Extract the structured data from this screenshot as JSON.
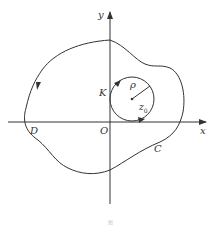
{
  "diagram": {
    "axes": {
      "x_label": "x",
      "y_label": "y",
      "origin_label": "O"
    },
    "curve": {
      "label": "C",
      "point_label": "D",
      "orientation": "counterclockwise"
    },
    "circle": {
      "label": "K",
      "radius_label": "ρ",
      "center_label": "z",
      "center_subscript": "0",
      "orientation": "counterclockwise"
    },
    "caption": "图"
  },
  "colors": {
    "stroke": "#333333",
    "background": "#ffffff"
  }
}
